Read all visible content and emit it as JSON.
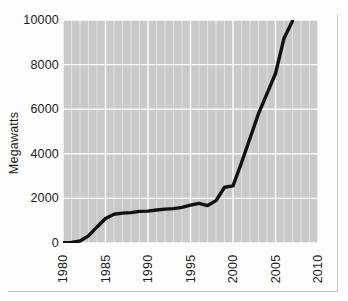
{
  "chart_data": {
    "type": "line",
    "title": "",
    "subtitle": "",
    "xlabel": "",
    "ylabel": "Megawatts",
    "xlim": [
      1980,
      2010
    ],
    "ylim": [
      0,
      10000
    ],
    "grid": true,
    "grid_color": "#ffffff",
    "plot_background": "#c9c9c9",
    "line_color": "#111111",
    "line_width": 3.4,
    "legend": "none",
    "x_ticks": [
      1980,
      1985,
      1990,
      1995,
      2000,
      2005,
      2010
    ],
    "x_tick_labels": [
      "1980",
      "1985",
      "1990",
      "1995",
      "2000",
      "2005",
      "2010"
    ],
    "y_ticks": [
      0,
      2000,
      4000,
      6000,
      8000,
      10000
    ],
    "y_tick_labels": [
      "0",
      "2000",
      "4000",
      "6000",
      "8000",
      "10000"
    ],
    "x_minor_tick_step": 1,
    "series": [
      {
        "name": "Installed capacity",
        "x": [
          1980,
          1981,
          1982,
          1983,
          1984,
          1985,
          1986,
          1987,
          1988,
          1989,
          1990,
          1991,
          1992,
          1993,
          1994,
          1995,
          1996,
          1997,
          1998,
          1999,
          2000,
          2001,
          2002,
          2003,
          2004,
          2005,
          2006,
          2007
        ],
        "values": [
          10,
          30,
          90,
          320,
          720,
          1100,
          1290,
          1340,
          1360,
          1420,
          1430,
          1480,
          1520,
          1540,
          1600,
          1700,
          1780,
          1680,
          1900,
          2500,
          2560,
          3600,
          4700,
          5800,
          6700,
          7600,
          9180,
          9950
        ]
      }
    ]
  },
  "axes": {
    "y_title_text": "Megawatts"
  }
}
